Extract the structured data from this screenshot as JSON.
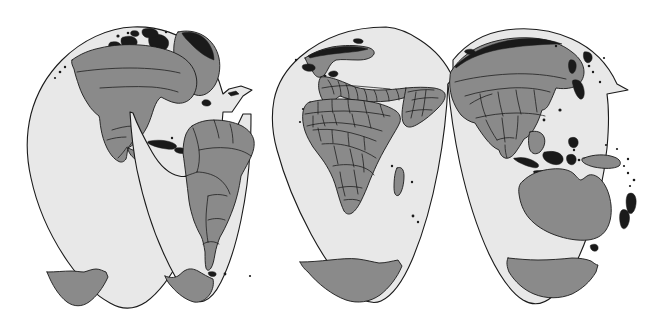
{
  "figure": {
    "type": "map",
    "projection": "Interrupted Goode homolosine",
    "canvas": {
      "width": 649,
      "height": 326
    },
    "colors": {
      "background": "#ffffff",
      "ocean": "#e8e8e8",
      "land": "#8a8a8a",
      "outline": "#1a1a1a",
      "island_fill": "#1a1a1a"
    },
    "lobes": [
      {
        "name": "north-america-lobe",
        "central_meridian": -100,
        "x_range": [
          22,
          253
        ]
      },
      {
        "name": "south-america-lobe",
        "central_meridian": -60,
        "x_range": [
          130,
          290
        ]
      },
      {
        "name": "europe-africa-lobe",
        "central_meridian": 20,
        "x_range": [
          272,
          470
        ]
      },
      {
        "name": "asia-australia-lobe",
        "central_meridian": 140,
        "x_range": [
          430,
          628
        ]
      }
    ],
    "landmasses": [
      {
        "name": "greenland",
        "lobe": "north-america-lobe"
      },
      {
        "name": "north-america",
        "lobe": "north-america-lobe"
      },
      {
        "name": "central-america",
        "lobe": "north-america-lobe"
      },
      {
        "name": "caribbean-islands",
        "lobe": "north-america-lobe"
      },
      {
        "name": "canadian-arctic-archipelago",
        "lobe": "north-america-lobe"
      },
      {
        "name": "south-america",
        "lobe": "south-america-lobe"
      },
      {
        "name": "europe",
        "lobe": "europe-africa-lobe"
      },
      {
        "name": "scandinavia",
        "lobe": "europe-africa-lobe"
      },
      {
        "name": "iceland",
        "lobe": "europe-africa-lobe"
      },
      {
        "name": "africa",
        "lobe": "europe-africa-lobe"
      },
      {
        "name": "madagascar",
        "lobe": "europe-africa-lobe"
      },
      {
        "name": "middle-east",
        "lobe": "europe-africa-lobe"
      },
      {
        "name": "russia-asia",
        "lobe": "asia-australia-lobe"
      },
      {
        "name": "china-india",
        "lobe": "asia-australia-lobe"
      },
      {
        "name": "japan",
        "lobe": "asia-australia-lobe"
      },
      {
        "name": "indonesia",
        "lobe": "asia-australia-lobe"
      },
      {
        "name": "new-guinea",
        "lobe": "asia-australia-lobe"
      },
      {
        "name": "australia",
        "lobe": "asia-australia-lobe"
      },
      {
        "name": "new-zealand",
        "lobe": "asia-australia-lobe"
      },
      {
        "name": "antarctica",
        "lobe": "all"
      }
    ],
    "features": {
      "country_borders": true,
      "graticule": false,
      "labels": false,
      "legend": false
    }
  }
}
